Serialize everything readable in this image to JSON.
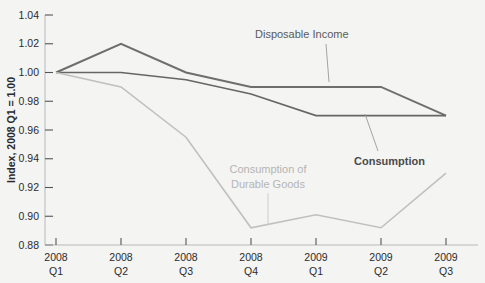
{
  "chart_data": {
    "type": "line",
    "title": "",
    "subtitle": "",
    "xlabel": "",
    "ylabel": "Index, 2008 Q1 = 1.00",
    "categories": [
      "2008 Q1",
      "2008 Q2",
      "2008 Q3",
      "2008 Q4",
      "2009 Q1",
      "2009 Q2",
      "2009 Q3"
    ],
    "category_lines": [
      [
        "2008",
        "Q1"
      ],
      [
        "2008",
        "Q2"
      ],
      [
        "2008",
        "Q3"
      ],
      [
        "2008",
        "Q4"
      ],
      [
        "2009",
        "Q1"
      ],
      [
        "2009",
        "Q2"
      ],
      [
        "2009",
        "Q3"
      ]
    ],
    "ylim": [
      0.88,
      1.04
    ],
    "ytick_values": [
      0.88,
      0.9,
      0.92,
      0.94,
      0.96,
      0.98,
      1.0,
      1.02,
      1.04
    ],
    "ytick_labels": [
      "0.88",
      "0.90",
      "0.92",
      "0.94",
      "0.96",
      "0.98",
      "1.00",
      "1.02",
      "1.04"
    ],
    "grid": false,
    "legend_position": "inline-annotations",
    "series": [
      {
        "name": "Disposable Income",
        "color": "#6e6e6e",
        "width": 2.0,
        "values": [
          1.0,
          1.02,
          1.0,
          0.99,
          0.99,
          0.99,
          0.97
        ]
      },
      {
        "name": "Consumption",
        "color": "#666666",
        "width": 1.6,
        "values": [
          1.0,
          1.0,
          0.995,
          0.985,
          0.97,
          0.97,
          0.97
        ]
      },
      {
        "name": "Consumption of Durable Goods",
        "color": "#c0c0c0",
        "width": 1.6,
        "values": [
          1.0,
          0.99,
          0.955,
          0.892,
          0.901,
          0.892,
          0.93
        ]
      }
    ],
    "annotations": [
      {
        "id": "disposable-income",
        "text": "Disposable Income",
        "text_x": 255,
        "text_y": 38,
        "anchor": "start",
        "color": "#5a5a5a",
        "bold": false,
        "leader": {
          "x1": 326,
          "y1": 44,
          "x2": 329,
          "y2": 82,
          "color": "#9a9a9a"
        }
      },
      {
        "id": "consumption",
        "text": "Consumption",
        "text_x": 354,
        "text_y": 165,
        "anchor": "start",
        "color": "#4a4a4a",
        "bold": true,
        "leader": {
          "x1": 378,
          "y1": 151,
          "x2": 365,
          "y2": 114,
          "color": "#9a9a9a"
        }
      },
      {
        "id": "consumption-durable-goods",
        "text_lines": [
          "Consumption of",
          "Durable Goods"
        ],
        "text_x": 268,
        "text_y": 173,
        "anchor": "middle",
        "color": "#b4b4b4",
        "bold": false,
        "leader": {
          "x1": 268,
          "y1": 193,
          "x2": 268,
          "y2": 225,
          "color": "#c8c8c8"
        }
      }
    ]
  },
  "colors": {
    "background": "#f4f4f3",
    "axis": "#b9b9b9",
    "tick": "#555555",
    "text": "#2b2b2b",
    "disposable_income": "#6e6e6e",
    "consumption": "#666666",
    "durable_goods": "#c0c0c0"
  }
}
